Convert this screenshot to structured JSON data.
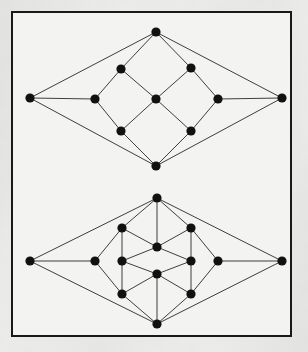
{
  "figure": {
    "background_color": "#ececeb",
    "plate_background_color": "#f3f3f1",
    "border_color": "#19191b",
    "vertex_color": "#111111",
    "edge_color": "#34343a",
    "vertex_radius": 4.6,
    "edge_width": 0.95,
    "caption": ""
  },
  "graphs": [
    {
      "name": "upper-graph",
      "label": "upper rhombic graph",
      "vertex_count": 10,
      "edge_count": 16,
      "vertices": [
        {
          "id": "u-left",
          "label": "left apex",
          "x": 30,
          "y": 98
        },
        {
          "id": "u-right",
          "label": "right apex",
          "x": 282,
          "y": 98
        },
        {
          "id": "u-top",
          "label": "top apex",
          "x": 156,
          "y": 32
        },
        {
          "id": "u-bottom",
          "label": "bottom apex",
          "x": 156,
          "y": 166
        },
        {
          "id": "u-mid-left",
          "label": "middle left",
          "x": 95,
          "y": 99
        },
        {
          "id": "u-mid-right",
          "label": "middle right",
          "x": 218,
          "y": 99
        },
        {
          "id": "u-inner-tl",
          "label": "inner top left",
          "x": 121,
          "y": 69
        },
        {
          "id": "u-inner-tr",
          "label": "inner top right",
          "x": 191,
          "y": 68
        },
        {
          "id": "u-inner-bl",
          "label": "inner bottom left",
          "x": 121,
          "y": 131
        },
        {
          "id": "u-inner-br",
          "label": "inner bottom right",
          "x": 191,
          "y": 131
        },
        {
          "id": "u-center",
          "label": "center",
          "x": 156,
          "y": 99
        }
      ],
      "edges": [
        [
          "u-left",
          "u-top"
        ],
        [
          "u-left",
          "u-bottom"
        ],
        [
          "u-left",
          "u-mid-left"
        ],
        [
          "u-right",
          "u-top"
        ],
        [
          "u-right",
          "u-bottom"
        ],
        [
          "u-right",
          "u-mid-right"
        ],
        [
          "u-top",
          "u-inner-tl"
        ],
        [
          "u-top",
          "u-inner-tr"
        ],
        [
          "u-bottom",
          "u-inner-bl"
        ],
        [
          "u-bottom",
          "u-inner-br"
        ],
        [
          "u-mid-left",
          "u-inner-tl"
        ],
        [
          "u-mid-left",
          "u-inner-bl"
        ],
        [
          "u-mid-right",
          "u-inner-tr"
        ],
        [
          "u-mid-right",
          "u-inner-br"
        ],
        [
          "u-inner-tl",
          "u-center"
        ],
        [
          "u-inner-tr",
          "u-center"
        ],
        [
          "u-inner-bl",
          "u-center"
        ],
        [
          "u-inner-br",
          "u-center"
        ]
      ]
    },
    {
      "name": "lower-graph",
      "label": "lower rhombic graph",
      "vertex_count": 12,
      "edge_count": 20,
      "vertices": [
        {
          "id": "l-left",
          "label": "left apex",
          "x": 30,
          "y": 261
        },
        {
          "id": "l-right",
          "label": "right apex",
          "x": 282,
          "y": 261
        },
        {
          "id": "l-top",
          "label": "top apex",
          "x": 157,
          "y": 198
        },
        {
          "id": "l-bottom",
          "label": "bottom apex",
          "x": 157,
          "y": 324
        },
        {
          "id": "l-mid-left",
          "label": "middle left",
          "x": 95,
          "y": 261
        },
        {
          "id": "l-mid-right",
          "label": "middle right",
          "x": 218,
          "y": 261
        },
        {
          "id": "l-outer-tl",
          "label": "outer ring top left",
          "x": 122,
          "y": 228
        },
        {
          "id": "l-outer-tr",
          "label": "outer ring top right",
          "x": 191,
          "y": 228
        },
        {
          "id": "l-outer-bl",
          "label": "outer ring bottom left",
          "x": 122,
          "y": 294
        },
        {
          "id": "l-outer-br",
          "label": "outer ring bottom right",
          "x": 191,
          "y": 294
        },
        {
          "id": "l-inner-left",
          "label": "inner left",
          "x": 122,
          "y": 261
        },
        {
          "id": "l-inner-right",
          "label": "inner right",
          "x": 191,
          "y": 261
        },
        {
          "id": "l-center-top",
          "label": "upper center",
          "x": 157,
          "y": 247
        },
        {
          "id": "l-center-bot",
          "label": "lower center",
          "x": 157,
          "y": 274
        }
      ],
      "edges": [
        [
          "l-left",
          "l-top"
        ],
        [
          "l-left",
          "l-bottom"
        ],
        [
          "l-left",
          "l-mid-left"
        ],
        [
          "l-right",
          "l-top"
        ],
        [
          "l-right",
          "l-bottom"
        ],
        [
          "l-right",
          "l-mid-right"
        ],
        [
          "l-top",
          "l-outer-tl"
        ],
        [
          "l-top",
          "l-outer-tr"
        ],
        [
          "l-top",
          "l-center-top"
        ],
        [
          "l-bottom",
          "l-outer-bl"
        ],
        [
          "l-bottom",
          "l-outer-br"
        ],
        [
          "l-bottom",
          "l-center-bot"
        ],
        [
          "l-mid-left",
          "l-outer-tl"
        ],
        [
          "l-mid-left",
          "l-outer-bl"
        ],
        [
          "l-mid-right",
          "l-outer-tr"
        ],
        [
          "l-mid-right",
          "l-outer-br"
        ],
        [
          "l-outer-tl",
          "l-center-top"
        ],
        [
          "l-outer-tr",
          "l-center-top"
        ],
        [
          "l-outer-bl",
          "l-center-bot"
        ],
        [
          "l-outer-br",
          "l-center-bot"
        ],
        [
          "l-inner-left",
          "l-center-top"
        ],
        [
          "l-inner-right",
          "l-center-top"
        ],
        [
          "l-inner-left",
          "l-center-bot"
        ],
        [
          "l-inner-right",
          "l-center-bot"
        ],
        [
          "l-outer-tl",
          "l-inner-left"
        ],
        [
          "l-outer-bl",
          "l-inner-left"
        ],
        [
          "l-outer-tr",
          "l-inner-right"
        ],
        [
          "l-outer-br",
          "l-inner-right"
        ]
      ]
    }
  ]
}
